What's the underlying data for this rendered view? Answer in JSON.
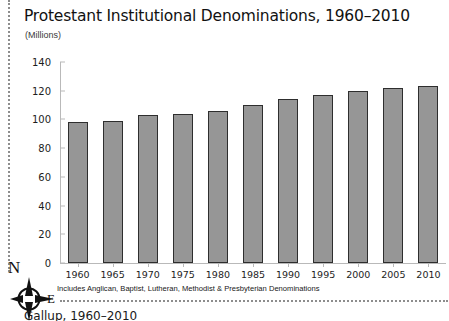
{
  "chart_data": {
    "type": "bar",
    "title": "Protestant Institutional Denominations, 1960–2010",
    "subtitle": "(Millions)",
    "xlabel": "",
    "ylabel": "",
    "ylim": [
      0,
      140
    ],
    "ytick_step": 20,
    "grid": false,
    "legend": "none",
    "categories": [
      "1960",
      "1965",
      "1970",
      "1975",
      "1980",
      "1985",
      "1990",
      "1995",
      "2000",
      "2005",
      "2010"
    ],
    "values": [
      98,
      99,
      103,
      104,
      106,
      110,
      114,
      117,
      120,
      122,
      123
    ],
    "ytick_labels": [
      "0",
      "20",
      "40",
      "60",
      "80",
      "100",
      "120",
      "140"
    ],
    "ytick_values": [
      0,
      20,
      40,
      60,
      80,
      100,
      120,
      140
    ],
    "footnote": "Includes Anglican, Baptist, Lutheran, Methodist & Presbyterian Denominations",
    "bar_fill_color": "#969696",
    "bar_border_color": "#2e2e2e",
    "axis_color": "#b9b9b9"
  },
  "compass": {
    "north_label": "N",
    "east_label": "E"
  },
  "source": {
    "text": "Gallup, 1960–2010"
  }
}
